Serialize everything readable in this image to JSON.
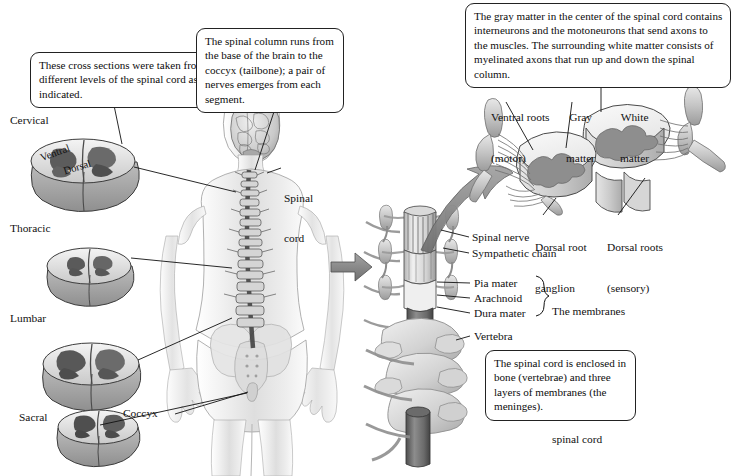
{
  "figure": {
    "background_color": "#ffffff",
    "ink_color": "#111111"
  },
  "callouts": [
    {
      "id": "cross-sections",
      "text": "These cross sections were taken from different levels of the spinal cord as indicated."
    },
    {
      "id": "spinal-column",
      "text": "The spinal column runs from the base of the brain to the coccyx (tailbone); a pair of nerves emerges from each segment."
    },
    {
      "id": "gray-matter",
      "text": "The gray matter in the center of the spinal cord contains interneurons and the motoneurons that send axons to the muscles. The surrounding white matter consists of myelinated axons that run up and down the spinal column."
    },
    {
      "id": "enclosed-in-bone",
      "text": "The spinal cord is enclosed in bone (vertebrae) and three layers of membranes (the meninges)."
    }
  ],
  "cross_sections": {
    "levels": [
      {
        "name": "Cervical"
      },
      {
        "name": "Thoracic"
      },
      {
        "name": "Lumbar"
      },
      {
        "name": "Sacral"
      }
    ],
    "orientation_labels": [
      {
        "name": "Ventral"
      },
      {
        "name": "Dorsal"
      }
    ]
  },
  "body_labels": [
    {
      "id": "spinal-cord",
      "line1": "Spinal",
      "line2": "cord"
    },
    {
      "id": "coccyx",
      "text": "Coccyx"
    }
  ],
  "vertebra_labels": [
    {
      "id": "spinal-nerve",
      "text": "Spinal nerve"
    },
    {
      "id": "sympathetic-chain",
      "text": "Sympathetic chain"
    },
    {
      "id": "pia-mater",
      "text": "Pia mater"
    },
    {
      "id": "arachnoid",
      "text": "Arachnoid"
    },
    {
      "id": "dura-mater",
      "text": "Dura mater"
    },
    {
      "id": "vertebra",
      "text": "Vertebra"
    }
  ],
  "meninges_note": {
    "line1": "The membranes",
    "line2": "(meninges) that",
    "line3": "surround the",
    "line4": "spinal cord"
  },
  "segment_labels": [
    {
      "id": "ventral-roots",
      "line1": "Ventral roots",
      "line2": "(motor)"
    },
    {
      "id": "gray-matter",
      "line1": "Gray",
      "line2": "matter"
    },
    {
      "id": "white-matter",
      "line1": "White",
      "line2": "matter"
    },
    {
      "id": "dorsal-root-ganglion",
      "line1": "Dorsal root",
      "line2": "ganglion"
    },
    {
      "id": "dorsal-roots",
      "line1": "Dorsal roots",
      "line2": "(sensory)"
    }
  ],
  "palette": {
    "outline": "#2b2b2b",
    "skin_light": "#efefef",
    "skin_mid": "#d8d8d8",
    "bone_light": "#e4e4e4",
    "bone_mid": "#c6c6c6",
    "bone_dark": "#9d9d9d",
    "gray_matter": "#8e8e8e",
    "white_matter": "#efefef",
    "cord_dark": "#6e6e6e",
    "arrow_gray": "#7b7b7b",
    "hair_dark": "#4a4a4a"
  }
}
